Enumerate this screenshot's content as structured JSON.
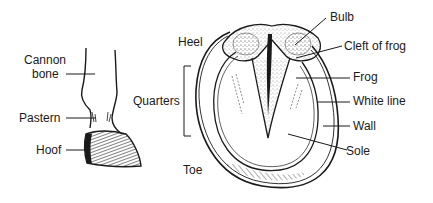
{
  "diagram": {
    "leg_labels": {
      "cannon_line1": "Cannon",
      "cannon_line2": "bone",
      "pastern": "Pastern",
      "hoof": "Hoof"
    },
    "sole_view_labels": {
      "heel": "Heel",
      "quarters": "Quarters",
      "toe": "Toe",
      "bulb": "Bulb",
      "cleft_of_frog": "Cleft of frog",
      "frog": "Frog",
      "white_line": "White line",
      "wall": "Wall",
      "sole": "Sole"
    },
    "colors": {
      "ink": "#1a1a1a",
      "background": "#ffffff"
    }
  }
}
